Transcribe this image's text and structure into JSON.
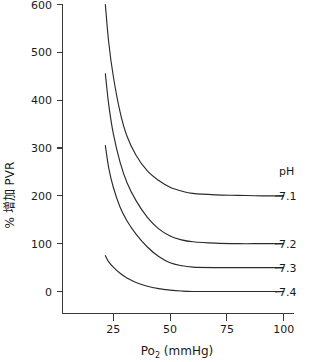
{
  "chart_data": {
    "type": "line",
    "title": "",
    "xlabel": "Po2 (mmHg)",
    "xlabel_main": "Po",
    "xlabel_sub": "2",
    "xlabel_unit": " (mmHg)",
    "ylabel": "% 增加 PVR",
    "xlim": [
      20,
      100
    ],
    "ylim": [
      0,
      600
    ],
    "xticks": [
      25,
      50,
      75,
      100
    ],
    "xtick_labels": [
      "25",
      "50",
      "75",
      "100"
    ],
    "yticks": [
      0,
      100,
      200,
      300,
      400,
      500,
      600
    ],
    "ytick_labels": [
      "0",
      "100",
      "200",
      "300",
      "400",
      "500",
      "600"
    ],
    "grid": false,
    "legend_position": "right",
    "legend_title": "pH",
    "series": [
      {
        "name": "7.1",
        "label": "7.1",
        "asymptote": 200,
        "x": [
          21.5,
          23,
          25,
          28,
          31,
          35,
          40,
          45,
          50,
          55,
          60,
          70,
          80,
          90,
          100
        ],
        "y": [
          600,
          520,
          450,
          375,
          325,
          285,
          252,
          232,
          218,
          210,
          205,
          202,
          201,
          200,
          200
        ]
      },
      {
        "name": "7.2",
        "label": "7.2",
        "asymptote": 100,
        "x": [
          21.5,
          23,
          25,
          28,
          31,
          35,
          40,
          45,
          50,
          55,
          60,
          70,
          80,
          90,
          100
        ],
        "y": [
          455,
          390,
          330,
          270,
          228,
          190,
          155,
          131,
          116,
          108,
          104,
          101,
          100,
          100,
          100
        ]
      },
      {
        "name": "7.3",
        "label": "7.3",
        "asymptote": 50,
        "x": [
          21.5,
          23,
          25,
          28,
          31,
          35,
          40,
          45,
          50,
          55,
          60,
          70,
          80,
          90,
          100
        ],
        "y": [
          305,
          258,
          218,
          176,
          148,
          120,
          93,
          73,
          60,
          54,
          51,
          50,
          50,
          50,
          50
        ]
      },
      {
        "name": "7.4",
        "label": "7.4",
        "asymptote": 0,
        "x": [
          21.5,
          23,
          25,
          28,
          31,
          35,
          40,
          45,
          50,
          55,
          60,
          70,
          80,
          90,
          100
        ],
        "y": [
          75,
          62,
          51,
          38,
          28,
          19,
          11,
          6,
          3,
          1,
          0,
          0,
          0,
          0,
          0
        ]
      }
    ],
    "colors": {
      "curve": "#2b2b2b",
      "axis": "#3a3a3a",
      "text": "#1a1a1a",
      "background": "#ffffff"
    }
  }
}
